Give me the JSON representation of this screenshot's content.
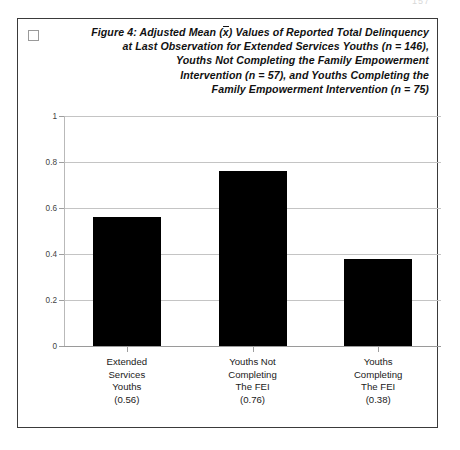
{
  "page": {
    "page_number_artifact": "157",
    "background_color": "#ffffff"
  },
  "figure": {
    "marker_icon": "empty-checkbox-icon",
    "title_lines": [
      "Figure 4:  Adjusted Mean (x̄) Values of Reported Total Delinquency",
      "at Last Observation for Extended Services Youths (n = 146),",
      "Youths Not Completing the Family Empowerment",
      "Intervention (n = 57), and Youths Completing the",
      "Family Empowerment Intervention  (n = 75)"
    ],
    "title_line_1_a": "Figure 4:  Adjusted Mean (",
    "title_line_1_b": "x",
    "title_line_1_c": ") Values of Reported Total Delinquency",
    "title_line_2": "at Last Observation for Extended Services Youths (n = 146),",
    "title_line_3": "Youths Not Completing the Family Empowerment",
    "title_line_4": "Intervention (n = 57), and Youths Completing the",
    "title_line_5": "Family Empowerment Intervention  (n = 75)"
  },
  "chart_data": {
    "type": "bar",
    "xlabel": "",
    "ylabel": "",
    "ylim": [
      0,
      1
    ],
    "yticks": [
      "0",
      "0.2",
      "0.4",
      "0.6",
      "0.8",
      "1"
    ],
    "ytick_values": [
      0,
      0.2,
      0.4,
      0.6,
      0.8,
      1
    ],
    "grid": true,
    "legend": false,
    "bar_color": "#000000",
    "categories": [
      "Extended Services Youths",
      "Youths Not Completing The FEI",
      "Youths Completing The FEI"
    ],
    "values": [
      0.56,
      0.76,
      0.38
    ],
    "category_lines": [
      [
        "Extended",
        "Services",
        "Youths"
      ],
      [
        "Youths Not",
        "Completing",
        "The FEI"
      ],
      [
        "Youths",
        "Completing",
        "The FEI"
      ]
    ],
    "value_labels": [
      "(0.56)",
      "(0.76)",
      "(0.38)"
    ],
    "n_values": [
      146,
      57,
      75
    ]
  }
}
